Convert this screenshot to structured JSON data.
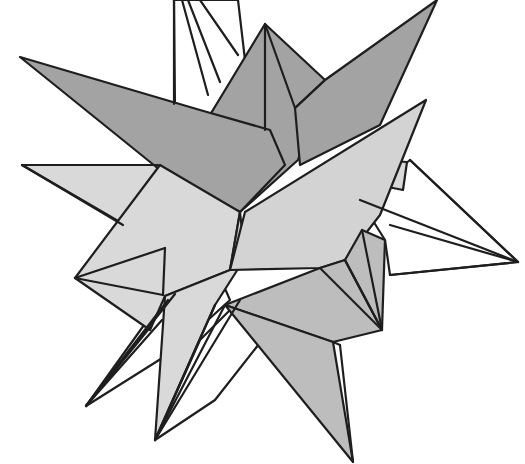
{
  "figure": {
    "width": 525,
    "height": 464,
    "colors": {
      "background": "#ffffff",
      "stroke": "#1e1e1e",
      "dark": "#a3a3a3",
      "medium": "#bdbdbd",
      "light": "#d9d9d9",
      "white": "#ffffff"
    },
    "faces": [
      {
        "name": "back-spike-top",
        "fill": "#ffffff",
        "points": "174,0 238,0 245,60 210,115 175,110"
      },
      {
        "name": "back-spike-right",
        "fill": "#ffffff",
        "points": "410,160 518,262 390,275 385,240 360,200"
      },
      {
        "name": "back-spike-lower-left",
        "fill": "#ffffff",
        "points": "86,406 162,300 208,250 230,300 175,350"
      },
      {
        "name": "back-spike-bottom",
        "fill": "#ffffff",
        "points": "155,440 200,340 240,300 270,330 215,400"
      },
      {
        "name": "spike-left-light",
        "fill": "#d9d9d9",
        "points": "22,165 160,165 125,225"
      },
      {
        "name": "right-small-facet",
        "fill": "#d9d9d9",
        "points": "375,160 407,162 403,190 378,185"
      },
      {
        "name": "spike-top-center-dark",
        "fill": "#a3a3a3",
        "points": "265,24 325,80 298,160 240,212 210,115"
      },
      {
        "name": "spike-upper-right-dark",
        "fill": "#a3a3a3",
        "points": "437,0 380,125 300,165 295,108 325,80"
      },
      {
        "name": "spike-left-dark",
        "fill": "#a3a3a3",
        "points": "20,57 200,110 270,130 285,165 240,212 160,170"
      },
      {
        "name": "lower-left-light-body",
        "fill": "#d9d9d9",
        "points": "75,278 160,165 240,212 230,270 165,296 150,330"
      },
      {
        "name": "spike-bottom-left-light",
        "fill": "#d9d9d9",
        "points": "155,440 165,296 230,270 240,212 245,258 215,305"
      },
      {
        "name": "spike-right-light",
        "fill": "#d3d3d3",
        "points": "426,100 380,215 345,260 320,268 230,270 245,212"
      },
      {
        "name": "right-lower-body",
        "fill": "#bdbdbd",
        "points": "320,268 345,260 382,330 333,342 225,305"
      },
      {
        "name": "right-side-facet",
        "fill": "#bdbdbd",
        "points": "345,260 362,230 385,240 382,330"
      },
      {
        "name": "spike-bottom-right",
        "fill": "#bdbdbd",
        "points": "225,305 333,342 353,462"
      }
    ],
    "edges": [
      [
        174,
        0,
        174,
        104
      ],
      [
        182,
        0,
        208,
        95
      ],
      [
        188,
        0,
        220,
        82
      ],
      [
        200,
        0,
        238,
        55
      ],
      [
        265,
        24,
        265,
        130
      ],
      [
        265,
        24,
        295,
        108
      ],
      [
        295,
        108,
        325,
        80
      ],
      [
        410,
        160,
        518,
        262
      ],
      [
        390,
        225,
        518,
        262
      ],
      [
        390,
        275,
        518,
        262
      ],
      [
        360,
        200,
        518,
        262
      ],
      [
        22,
        165,
        123,
        225
      ],
      [
        22,
        165,
        158,
        165
      ],
      [
        86,
        406,
        152,
        325
      ],
      [
        86,
        406,
        162,
        320
      ],
      [
        86,
        406,
        168,
        300
      ],
      [
        86,
        406,
        175,
        294
      ],
      [
        155,
        440,
        215,
        305
      ],
      [
        155,
        440,
        225,
        305
      ],
      [
        155,
        440,
        240,
        300
      ],
      [
        75,
        278,
        165,
        248
      ],
      [
        75,
        278,
        163,
        295
      ],
      [
        165,
        248,
        163,
        295
      ],
      [
        345,
        260,
        382,
        330
      ],
      [
        362,
        230,
        382,
        330
      ],
      [
        320,
        268,
        382,
        330
      ],
      [
        333,
        342,
        340,
        345
      ],
      [
        340,
        345,
        353,
        462
      ]
    ]
  }
}
